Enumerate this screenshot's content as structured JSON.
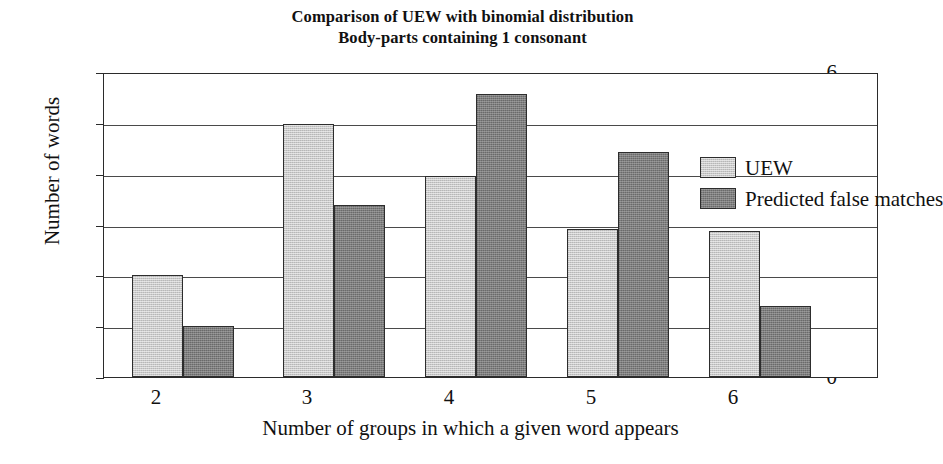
{
  "chart_data": {
    "type": "bar",
    "title": "Comparison of UEW with binomial distribution",
    "subtitle": "Body-parts containing 1 consonant",
    "title_lines": [
      "Comparison of UEW with binomial distribution",
      "Body-parts containing 1 consonant"
    ],
    "xlabel": "Number of groups in which a given word appears",
    "ylabel": "Number of words",
    "categories": [
      "2",
      "3",
      "4",
      "5",
      "6"
    ],
    "yticks": [
      "0",
      "1",
      "2",
      "3",
      "4",
      "5",
      "6"
    ],
    "ylim": [
      0,
      6
    ],
    "grid": "horizontal",
    "legend_position": "top-right-inside",
    "series": [
      {
        "name": "UEW",
        "color": "#c9c9c9",
        "values": [
          2.0,
          4.97,
          3.95,
          2.92,
          2.88
        ]
      },
      {
        "name": "Predicted false matches",
        "color": "#7e7e7e",
        "values": [
          1.0,
          3.38,
          5.57,
          4.42,
          1.4
        ]
      }
    ]
  },
  "legend": {
    "items": [
      {
        "label": "UEW"
      },
      {
        "label": "Predicted false matches"
      }
    ]
  },
  "colors": {
    "uew": "#c9c9c9",
    "predicted": "#7e7e7e",
    "axis": "#2b2b2b",
    "grid": "#4a4a4a",
    "background": "#ffffff"
  }
}
